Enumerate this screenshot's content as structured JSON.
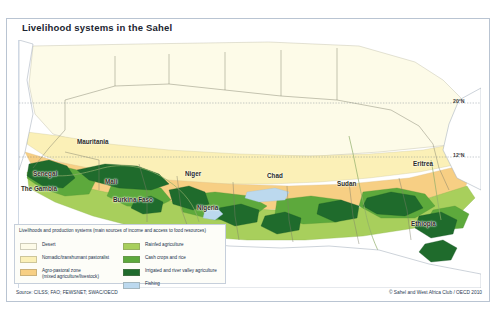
{
  "title": "Livelihood systems in the Sahel",
  "map": {
    "country_labels": [
      {
        "name": "Mauritania",
        "x": 58,
        "y": 103
      },
      {
        "name": "Senegal",
        "x": 22,
        "y": 137
      },
      {
        "name": "The Gambia",
        "x": 10,
        "y": 152
      },
      {
        "name": "Mali",
        "x": 88,
        "y": 146
      },
      {
        "name": "Burkina Faso",
        "x": 104,
        "y": 163
      },
      {
        "name": "Niger",
        "x": 172,
        "y": 139
      },
      {
        "name": "Nigeria",
        "x": 186,
        "y": 171
      },
      {
        "name": "Chad",
        "x": 254,
        "y": 140
      },
      {
        "name": "Sudan",
        "x": 325,
        "y": 147
      },
      {
        "name": "Eritrea",
        "x": 406,
        "y": 131
      },
      {
        "name": "Ethiopia",
        "x": 404,
        "y": 186
      }
    ],
    "latitude_labels": [
      {
        "text": "20°N",
        "x": 462,
        "y": 103
      },
      {
        "text": "12°N",
        "x": 462,
        "y": 157
      }
    ]
  },
  "legend": {
    "title_line1": "Livelihoods and production systems",
    "title_line2": "(main sources of income and access to food resources)",
    "left_items": [
      {
        "label": "Desert",
        "label2": "",
        "color": "#fdfbe8"
      },
      {
        "label": "Nomadic/transhumant pastoralist",
        "label2": "",
        "color": "#fbf0b7"
      },
      {
        "label": "Agro-pastoral zone",
        "label2": "(mixed agriculture/livestock)",
        "color": "#f7cf84"
      }
    ],
    "right_items": [
      {
        "label": "Rainfed agriculture",
        "label2": "",
        "color": "#a8cf5c"
      },
      {
        "label": "Cash crops and rice",
        "label2": "",
        "color": "#5da93c"
      },
      {
        "label": "Irrigated and river valley agriculture",
        "label2": "",
        "color": "#1f6b2c"
      },
      {
        "label": "Fishing",
        "label2": "",
        "color": "#bcd9ee"
      }
    ]
  },
  "footer": {
    "source": "Source: CILSS; FAO; FEWSNET; SWAC/OECD",
    "copyright": "© Sahel and West Africa Club / OECD 2010"
  },
  "colors": {
    "desert": "#fdfbe8",
    "pastoralist": "#fbf0b7",
    "agro_pastoral": "#f7cf84",
    "rainfed": "#a8cf5c",
    "cash_crops": "#5da93c",
    "irrigated": "#1f6b2c",
    "fishing": "#bcd9ee",
    "ocean": "#ffffff",
    "border": "#9a9a86"
  }
}
